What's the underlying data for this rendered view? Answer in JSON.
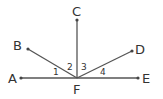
{
  "diagram": {
    "type": "geometry-rays",
    "vertex": {
      "id": "F",
      "label": "F",
      "x": 77,
      "y": 78
    },
    "rays": [
      {
        "id": "FA",
        "from": "F",
        "to": "A",
        "end": {
          "x": 21,
          "y": 78
        }
      },
      {
        "id": "FB",
        "from": "F",
        "to": "B",
        "end": {
          "x": 28,
          "y": 49
        }
      },
      {
        "id": "FC",
        "from": "F",
        "to": "C",
        "end": {
          "x": 77,
          "y": 20
        }
      },
      {
        "id": "FD",
        "from": "F",
        "to": "D",
        "end": {
          "x": 132,
          "y": 51
        }
      },
      {
        "id": "FE",
        "from": "F",
        "to": "E",
        "end": {
          "x": 138,
          "y": 78
        }
      }
    ],
    "point_labels": {
      "A": "A",
      "B": "B",
      "C": "C",
      "D": "D",
      "E": "E",
      "F": "F"
    },
    "angle_labels": {
      "a1": "1",
      "a2": "2",
      "a3": "3",
      "a4": "4"
    },
    "angles": [
      {
        "label": "1",
        "between": [
          "FA",
          "FB"
        ]
      },
      {
        "label": "2",
        "between": [
          "FB",
          "FC"
        ]
      },
      {
        "label": "3",
        "between": [
          "FC",
          "FD"
        ]
      },
      {
        "label": "4",
        "between": [
          "FD",
          "FE"
        ]
      }
    ],
    "colors": {
      "line": "#555555",
      "text": "#333333",
      "background": "#ffffff"
    }
  }
}
